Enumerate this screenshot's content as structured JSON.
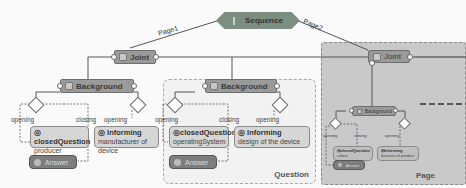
{
  "diagram": {
    "root": {
      "label": "Sequence",
      "icon": "sequence-icon"
    },
    "edges": {
      "left": "Page1",
      "right": "Page2"
    },
    "branch_left": {
      "joint": "Joint",
      "background": "Background",
      "gateways": {
        "opening": "opening",
        "closing": "closing"
      },
      "closed_question": {
        "title": "closedQuestion",
        "subtitle": "producer"
      },
      "informing": {
        "title": "Informing",
        "subtitle": "manufacturer of device"
      },
      "answer": "Answer"
    },
    "question_container": {
      "label": "Question",
      "background": "Background",
      "gateways": {
        "opening": "opening",
        "closing": "closing"
      },
      "closed_question": {
        "title": "closedQuestion",
        "subtitle": "operatingSystem"
      },
      "informing": {
        "title": "Informing",
        "subtitle": "design of the device"
      },
      "answer": "Answer"
    },
    "page_container": {
      "label": "Page",
      "joint": "Joint",
      "background": "Background",
      "gateways": {
        "opening": "opening",
        "closing": "closing"
      },
      "closed_question": {
        "title": "closedQuestion",
        "subtitle": "colour"
      },
      "informing": {
        "title": "Informing",
        "subtitle": "features of product"
      },
      "answer": "Answer"
    },
    "colors": {
      "node_fill": "#9a9a9a",
      "sequence_fill": "#7a8f80",
      "leaf_fill": "#d6d6d6",
      "answer_fill": "#7d7d7d",
      "page_fill": "#c9c9c9",
      "question_fill": "#f2f2f2"
    }
  }
}
